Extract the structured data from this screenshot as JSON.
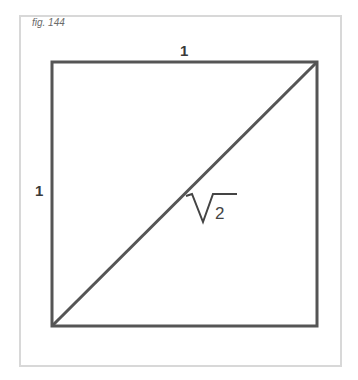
{
  "figure": {
    "label": "fig. 144",
    "frame_color": "#d8d8d8",
    "stroke_color": "#555555"
  },
  "square": {
    "top_side_label": "1",
    "left_side_label": "1",
    "diagonal_label_radicand": "2",
    "diagonal_label_symbol": "square-root"
  }
}
